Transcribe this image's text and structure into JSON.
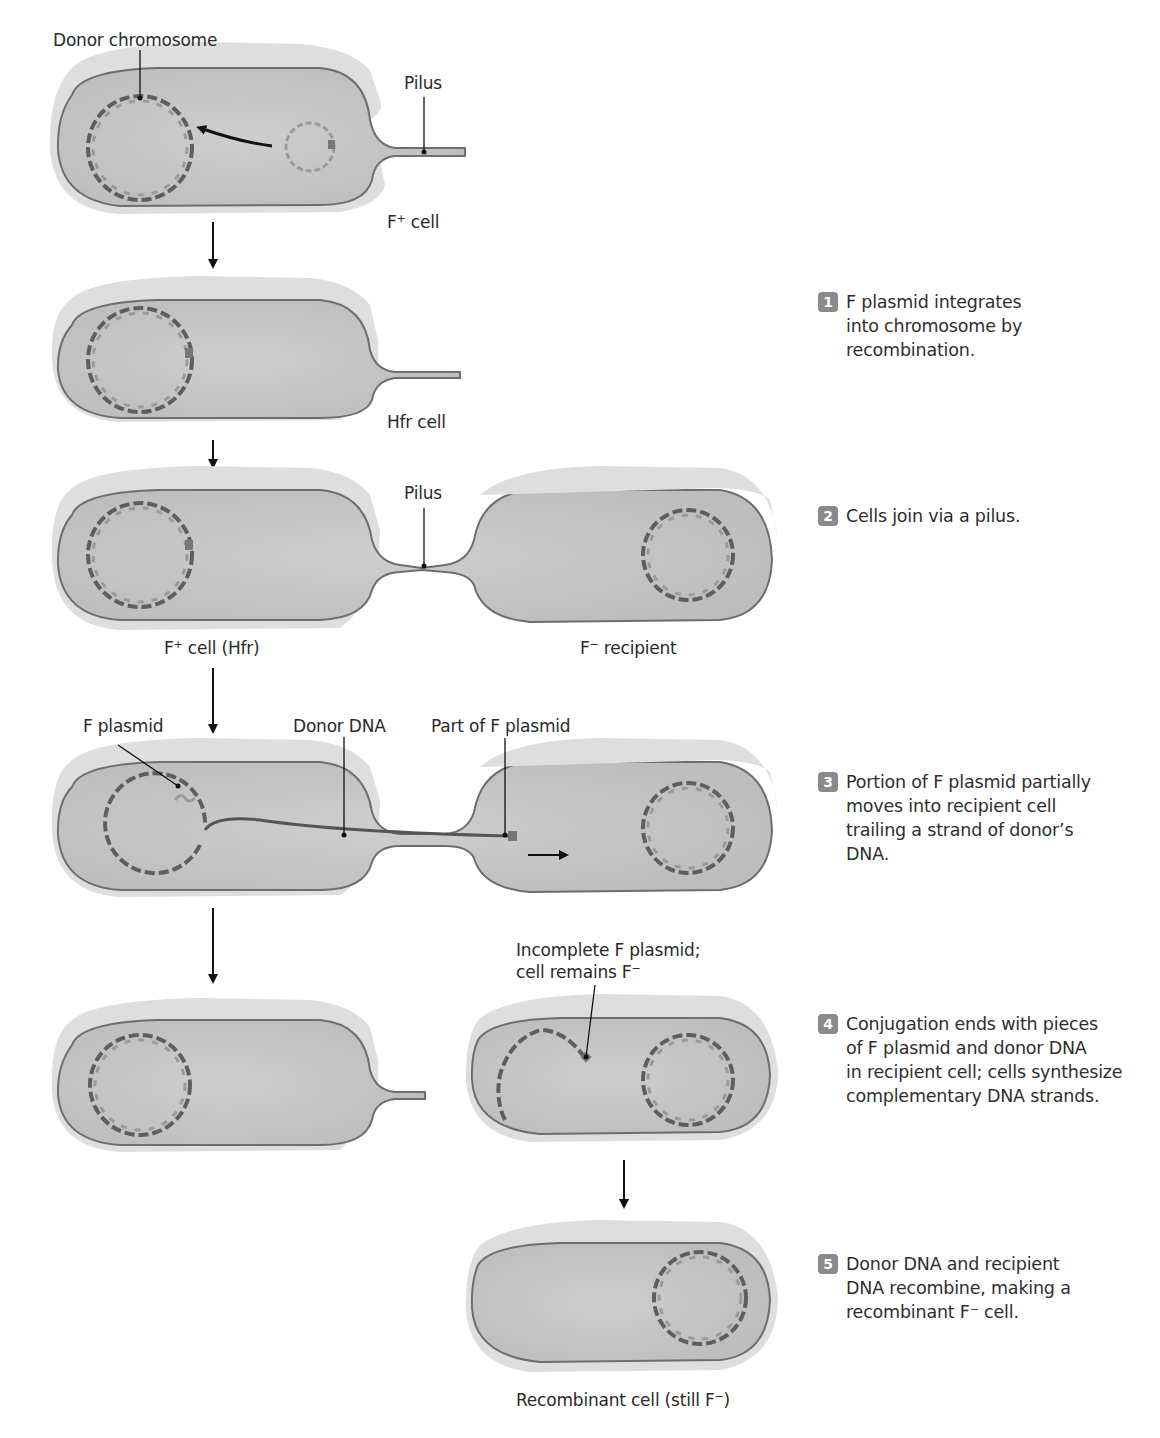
{
  "diagram": {
    "colors": {
      "cell_fill": "#c9c9c9",
      "cell_outer": "#dcdcdc",
      "membrane": "#6e6e6e",
      "dna_dark": "#5e5e5e",
      "dna_light": "#a8a8a8",
      "arrow": "#111111",
      "badge": "#8a8a8a"
    },
    "labels": {
      "donor_chromosome": "Donor chromosome",
      "pilus_top": "Pilus",
      "f_plus_cell": "F",
      "f_plus_cell_sup": "+",
      "f_plus_cell_rest": " cell",
      "hfr_cell": "Hfr cell",
      "pilus_mid": "Pilus",
      "f_plus_hfr_a": "F",
      "f_plus_hfr_sup": "+",
      "f_plus_hfr_b": " cell (Hfr)",
      "f_minus_recipient_a": "F",
      "f_minus_recipient_sup": "−",
      "f_minus_recipient_b": " recipient",
      "f_plasmid": "F plasmid",
      "donor_dna": "Donor DNA",
      "part_of_f_plasmid": "Part of F plasmid",
      "incomplete_line1": "Incomplete F plasmid;",
      "incomplete_line2a": "cell remains F",
      "incomplete_line2_sup": "−",
      "recombinant_a": "Recombinant cell (still F",
      "recombinant_sup": "−",
      "recombinant_b": ")"
    },
    "steps": [
      {
        "number": "1",
        "text": "F plasmid integrates\ninto chromosome by\nrecombination."
      },
      {
        "number": "2",
        "text": "Cells join via a pilus."
      },
      {
        "number": "3",
        "text": "Portion of F plasmid partially\nmoves into recipient cell\ntrailing a strand of donor’s\nDNA."
      },
      {
        "number": "4",
        "text": "Conjugation ends with pieces\nof F plasmid and donor DNA\nin recipient cell; cells synthesize\ncomplementary DNA strands."
      },
      {
        "number": "5",
        "text": "Donor DNA and recipient\nDNA recombine, making a\nrecombinant F⁻ cell."
      }
    ]
  }
}
